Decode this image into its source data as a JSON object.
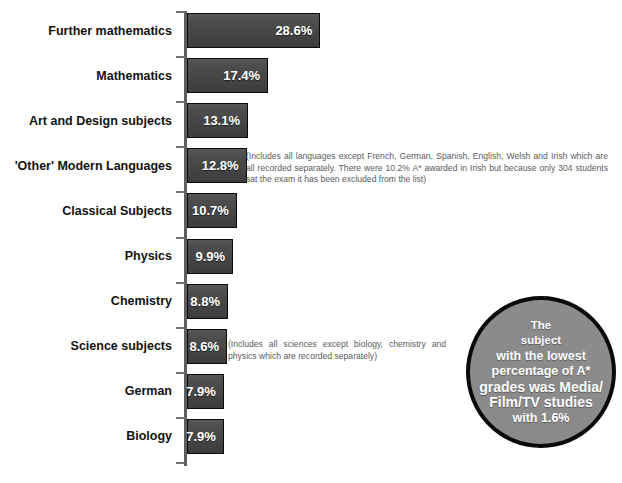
{
  "chart_data": {
    "type": "bar",
    "orientation": "horizontal",
    "title": "",
    "xlabel": "",
    "ylabel": "",
    "grid": false,
    "legend": null,
    "xlim": [
      0,
      28.6
    ],
    "value_suffix": "%",
    "categories": [
      "Further mathematics",
      "Mathematics",
      "Art and Design subjects",
      "'Other' Modern Languages",
      "Classical Subjects",
      "Physics",
      "Chemistry",
      "Science subjects",
      "German",
      "Biology"
    ],
    "values": [
      28.6,
      17.4,
      13.1,
      12.8,
      10.7,
      9.9,
      8.8,
      8.6,
      7.9,
      7.9
    ],
    "value_labels": [
      "28.6%",
      "17.4%",
      "13.1%",
      "12.8%",
      "10.7%",
      "9.9%",
      "8.8%",
      "8.6%",
      "7.9%",
      "7.9%"
    ],
    "annotations": [
      {
        "attached_to": "'Other' Modern Languages",
        "text": "(Includes all languages except French, German, Spanish, English, Welsh and Irish which are all recorded separately. There were 10.2% A* awarded in Irish but because only 304 students sat the exam it has been excluded from the list)"
      },
      {
        "attached_to": "Science subjects",
        "text": "(Includes all sciences except biology, chemistry and physics which are recorded separately)"
      }
    ]
  },
  "callout": {
    "lines": [
      "The",
      "subject",
      "with the lowest",
      "percentage of A*",
      "grades was Media/",
      "Film/TV studies",
      "with 1.6%"
    ]
  },
  "colors": {
    "bar_fill": "#4a4a4a",
    "bar_border": "#0b0b0b",
    "value_text": "#ffffff",
    "label_text": "#121212",
    "note_text": "#5b5b5b",
    "axis": "#5e5e5e",
    "callout_fill": "#8b8b8b",
    "callout_border": "#0a0a0a",
    "background": "#ffffff"
  }
}
